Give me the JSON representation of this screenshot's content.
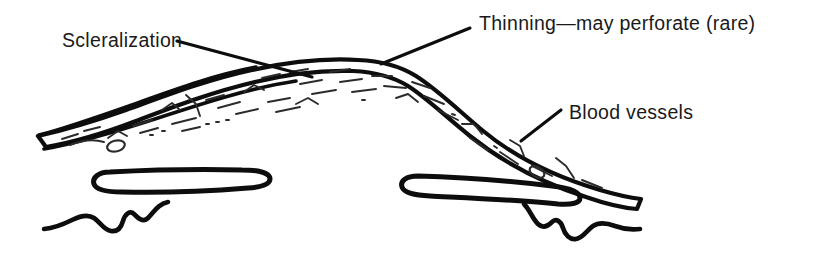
{
  "figure": {
    "background_color": "#ffffff",
    "ink_color": "#0d0d0d",
    "text_color": "#1a1a1a"
  },
  "labels": [
    {
      "id": "scleralization",
      "text": "Scleralization",
      "x": 62,
      "y": 47,
      "anchor": "start"
    },
    {
      "id": "thinning",
      "text": "Thinning—may perforate (rare)",
      "x": 479,
      "y": 30,
      "anchor": "start"
    },
    {
      "id": "blood-vessels",
      "text": "Blood vessels",
      "x": 569,
      "y": 119,
      "anchor": "start"
    }
  ],
  "leaders": [
    {
      "id": "scleralization-leader",
      "from_x": 177,
      "from_y": 41,
      "to_x": 312,
      "to_y": 77
    },
    {
      "id": "thinning-leader",
      "from_x": 470,
      "from_y": 28,
      "to_x": 381,
      "to_y": 64
    },
    {
      "id": "blood-vessels-leader",
      "from_x": 561,
      "from_y": 110,
      "to_x": 521,
      "to_y": 141
    }
  ],
  "structures": [
    {
      "id": "sclera-band",
      "name": "arched scleral tissue band"
    },
    {
      "id": "inner-loop-left",
      "name": "left elongated loop"
    },
    {
      "id": "inner-loop-right",
      "name": "right elongated loop"
    },
    {
      "id": "ciliary-tail-left",
      "name": "left wavy ciliary tail"
    },
    {
      "id": "ciliary-tail-right",
      "name": "right wavy ciliary tail"
    }
  ]
}
